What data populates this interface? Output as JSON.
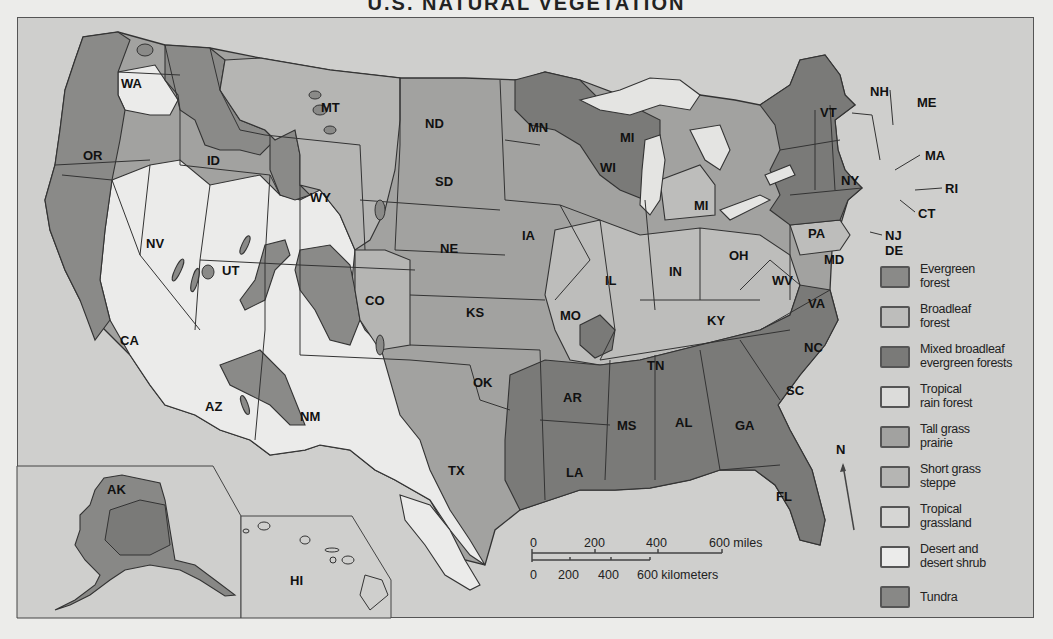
{
  "title": "U.S. NATURAL VEGETATION",
  "colors": {
    "background": "#cfcfcd",
    "evergreen_forest": "#8a8a88",
    "broadleaf_forest": "#bdbdbb",
    "mixed_forest": "#7a7a78",
    "tropical_rain_forest": "#dcdcda",
    "tall_grass_prairie": "#a2a2a0",
    "short_grass_steppe": "#b5b5b3",
    "tropical_grassland": "#d6d6d4",
    "desert": "#ebebea",
    "tundra": "#888886",
    "lake": "#e4e4e2",
    "border": "#333333"
  },
  "legend": [
    {
      "label_line1": "Evergreen",
      "label_line2": "forest",
      "color": "#8a8a88"
    },
    {
      "label_line1": "Broadleaf",
      "label_line2": "forest",
      "color": "#bdbdbb"
    },
    {
      "label_line1": "Mixed broadleaf",
      "label_line2": "evergreen forests",
      "color": "#7a7a78"
    },
    {
      "label_line1": "Tropical",
      "label_line2": "rain forest",
      "color": "#dcdcda"
    },
    {
      "label_line1": "Tall grass",
      "label_line2": "prairie",
      "color": "#a2a2a0"
    },
    {
      "label_line1": "Short grass",
      "label_line2": "steppe",
      "color": "#b5b5b3"
    },
    {
      "label_line1": "Tropical",
      "label_line2": "grassland",
      "color": "#d6d6d4"
    },
    {
      "label_line1": "Desert and",
      "label_line2": "desert shrub",
      "color": "#ebebea"
    },
    {
      "label_line1": "Tundra",
      "label_line2": "",
      "color": "#888886"
    }
  ],
  "states": {
    "WA": "WA",
    "OR": "OR",
    "CA": "CA",
    "ID": "ID",
    "NV": "NV",
    "MT": "MT",
    "WY": "WY",
    "UT": "UT",
    "AZ": "AZ",
    "CO": "CO",
    "NM": "NM",
    "ND": "ND",
    "SD": "SD",
    "NE": "NE",
    "KS": "KS",
    "OK": "OK",
    "TX": "TX",
    "MN": "MN",
    "IA": "IA",
    "MO": "MO",
    "AR": "AR",
    "LA": "LA",
    "WI": "WI",
    "IL": "IL",
    "MI_upper": "MI",
    "MI_lower": "MI",
    "IN": "IN",
    "OH": "OH",
    "KY": "KY",
    "TN": "TN",
    "MS": "MS",
    "AL": "AL",
    "GA": "GA",
    "FL": "FL",
    "SC": "SC",
    "NC": "NC",
    "VA": "VA",
    "WV": "WV",
    "PA": "PA",
    "NY": "NY",
    "VT": "VT",
    "NH": "NH",
    "ME": "ME",
    "MA": "MA",
    "RI": "RI",
    "CT": "CT",
    "NJ": "NJ",
    "DE": "DE",
    "MD": "MD",
    "AK": "AK",
    "HI": "HI"
  },
  "scale": {
    "miles_ticks": [
      "0",
      "200",
      "400",
      "600 miles"
    ],
    "km_ticks": [
      "0",
      "200",
      "400",
      "600 kilometers"
    ]
  },
  "north_arrow": "N"
}
